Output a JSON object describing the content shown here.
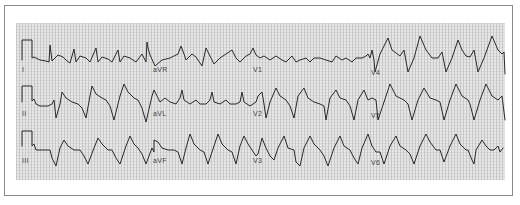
{
  "figure": {
    "type": "12-lead ECG",
    "layout": "3 rows x 4 columns",
    "colors": {
      "trace": "#2a2a2a",
      "grid_bg": "#e6e6e6",
      "frame": "#8a8a8a"
    }
  },
  "leads": [
    {
      "name": "I",
      "row": 0,
      "col": 0,
      "label_x": 22,
      "label_y": 70
    },
    {
      "name": "aVR",
      "row": 0,
      "col": 1,
      "label_x": 153,
      "label_y": 70
    },
    {
      "name": "V1",
      "row": 0,
      "col": 2,
      "label_x": 253,
      "label_y": 70
    },
    {
      "name": "V4",
      "row": 0,
      "col": 3,
      "label_x": 370,
      "label_y": 72
    },
    {
      "name": "II",
      "row": 1,
      "col": 0,
      "label_x": 22,
      "label_y": 114
    },
    {
      "name": "aVL",
      "row": 1,
      "col": 1,
      "label_x": 153,
      "label_y": 114
    },
    {
      "name": "V2",
      "row": 1,
      "col": 2,
      "label_x": 253,
      "label_y": 114
    },
    {
      "name": "V5",
      "row": 1,
      "col": 3,
      "label_x": 370,
      "label_y": 116
    },
    {
      "name": "III",
      "row": 2,
      "col": 0,
      "label_x": 22,
      "label_y": 160
    },
    {
      "name": "aVF",
      "row": 2,
      "col": 1,
      "label_x": 153,
      "label_y": 160
    },
    {
      "name": "V3",
      "row": 2,
      "col": 2,
      "label_x": 253,
      "label_y": 160
    },
    {
      "name": "V6",
      "row": 2,
      "col": 3,
      "label_x": 370,
      "label_y": 162
    }
  ]
}
